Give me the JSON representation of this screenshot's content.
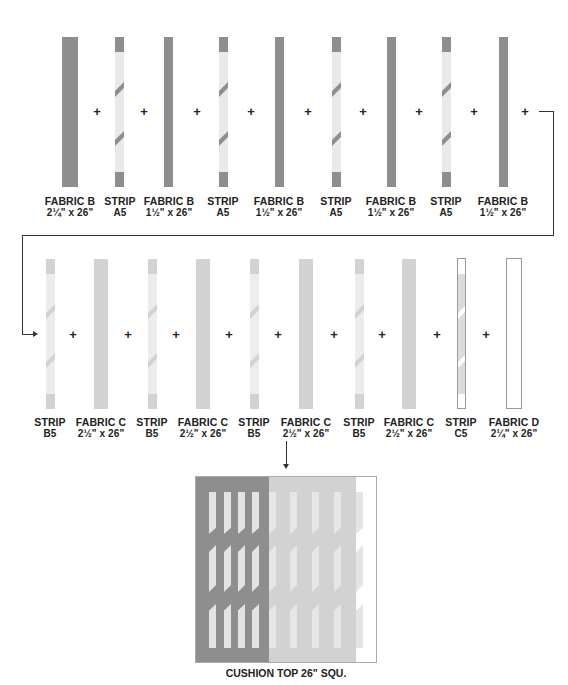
{
  "colors": {
    "fabric_b": "#8e8e8e",
    "fabric_c": "#d2d2d2",
    "fabric_d": "#ffffff",
    "strip_light": "#e9e9e9",
    "strip_b_light": "#ececec",
    "outline": "#9a9a9a",
    "text": "#222222"
  },
  "row1": {
    "pieces": [
      {
        "type": "fabric",
        "name": "FABRIC B",
        "size": "2¼\" x 26\""
      },
      {
        "type": "strip",
        "name": "STRIP",
        "size": "A5"
      },
      {
        "type": "fabric",
        "name": "FABRIC B",
        "size": "1½\" x 26\""
      },
      {
        "type": "strip",
        "name": "STRIP",
        "size": "A5"
      },
      {
        "type": "fabric",
        "name": "FABRIC B",
        "size": "1½\" x 26\""
      },
      {
        "type": "strip",
        "name": "STRIP",
        "size": "A5"
      },
      {
        "type": "fabric",
        "name": "FABRIC B",
        "size": "1½\" x 26\""
      },
      {
        "type": "strip",
        "name": "STRIP",
        "size": "A5"
      },
      {
        "type": "fabric",
        "name": "FABRIC B",
        "size": "1½\" x 26\""
      }
    ],
    "plus": "+"
  },
  "row2": {
    "pieces": [
      {
        "type": "strip",
        "name": "STRIP",
        "size": "B5"
      },
      {
        "type": "fabric",
        "name": "FABRIC C",
        "size": "2½\" x 26\""
      },
      {
        "type": "strip",
        "name": "STRIP",
        "size": "B5"
      },
      {
        "type": "fabric",
        "name": "FABRIC C",
        "size": "2½\" x 26\""
      },
      {
        "type": "strip",
        "name": "STRIP",
        "size": "B5"
      },
      {
        "type": "fabric",
        "name": "FABRIC C",
        "size": "2½\" x 26\""
      },
      {
        "type": "strip",
        "name": "STRIP",
        "size": "B5"
      },
      {
        "type": "fabric",
        "name": "FABRIC C",
        "size": "2½\" x 26\""
      },
      {
        "type": "strip",
        "name": "STRIP",
        "size": "C5"
      },
      {
        "type": "fabric",
        "name": "FABRIC D",
        "size": "2¼\" x 26\""
      }
    ],
    "plus": "+"
  },
  "result": {
    "label": "CUSHION TOP 26\" SQU."
  }
}
